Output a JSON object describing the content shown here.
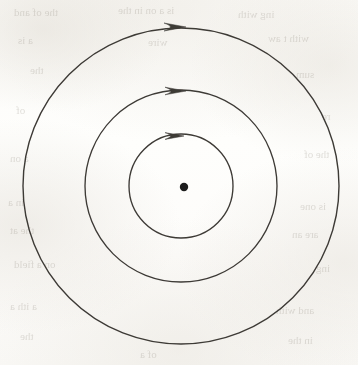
{
  "figure": {
    "kind": "scanned-textbook-diagram",
    "canvas": {
      "width": 358,
      "height": 365
    },
    "colors": {
      "paper": "#fdfdfb",
      "ink": "#3d3a36",
      "ghost_text": "#9c968c"
    }
  },
  "diagram": {
    "center": {
      "x": 181,
      "y": 186
    },
    "center_dot": {
      "label": "center-point",
      "x": 184,
      "y": 187,
      "radius": 4.2,
      "fill": "#1f1d1b"
    },
    "circles": [
      {
        "label": "inner-circle",
        "radius": 52,
        "stroke_width": 1.35
      },
      {
        "label": "middle-circle",
        "radius": 96,
        "stroke_width": 1.35
      },
      {
        "label": "outer-circle",
        "radius": 158,
        "stroke_width": 1.4
      }
    ],
    "arrows": [
      {
        "label": "inner-arrowhead",
        "tip_x": 184,
        "tip_y": 136,
        "length": 19,
        "half_height": 3.4,
        "direction": "clockwise"
      },
      {
        "label": "middle-arrowhead",
        "tip_x": 186,
        "tip_y": 91,
        "length": 21,
        "half_height": 3.8,
        "direction": "clockwise"
      },
      {
        "label": "outer-arrowhead",
        "tip_x": 186,
        "tip_y": 27,
        "length": 22,
        "half_height": 4.0,
        "direction": "clockwise"
      }
    ]
  },
  "bleed_through_text": [
    {
      "text": "the    of   and",
      "x": 14,
      "y": 6,
      "size": 11
    },
    {
      "text": "is  a  on   in   the",
      "x": 118,
      "y": 4,
      "size": 11
    },
    {
      "text": "ing     with",
      "x": 238,
      "y": 8,
      "size": 11
    },
    {
      "text": "a    is",
      "x": 18,
      "y": 34,
      "size": 11
    },
    {
      "text": "wire",
      "x": 148,
      "y": 36,
      "size": 11
    },
    {
      "text": "with  t  aw",
      "x": 268,
      "y": 32,
      "size": 11
    },
    {
      "text": "the",
      "x": 30,
      "y": 64,
      "size": 11
    },
    {
      "text": "sum",
      "x": 296,
      "y": 68,
      "size": 11
    },
    {
      "text": "of",
      "x": 16,
      "y": 104,
      "size": 11
    },
    {
      "text": "re",
      "x": 322,
      "y": 110,
      "size": 11
    },
    {
      "text": "a   on",
      "x": 10,
      "y": 152,
      "size": 11
    },
    {
      "text": "the   of",
      "x": 304,
      "y": 148,
      "size": 11
    },
    {
      "text": "in  a",
      "x": 8,
      "y": 196,
      "size": 11
    },
    {
      "text": "is   one",
      "x": 300,
      "y": 200,
      "size": 11
    },
    {
      "text": "the    at",
      "x": 10,
      "y": 224,
      "size": 11
    },
    {
      "text": "are    an",
      "x": 292,
      "y": 228,
      "size": 11
    },
    {
      "text": "on  a   field",
      "x": 14,
      "y": 258,
      "size": 11
    },
    {
      "text": "ing",
      "x": 316,
      "y": 262,
      "size": 11
    },
    {
      "text": "a    ith    a",
      "x": 10,
      "y": 300,
      "size": 11
    },
    {
      "text": "and    with",
      "x": 276,
      "y": 304,
      "size": 11
    },
    {
      "text": "the",
      "x": 20,
      "y": 330,
      "size": 11
    },
    {
      "text": "in  the",
      "x": 288,
      "y": 334,
      "size": 11
    },
    {
      "text": "of    a",
      "x": 140,
      "y": 348,
      "size": 11
    }
  ]
}
